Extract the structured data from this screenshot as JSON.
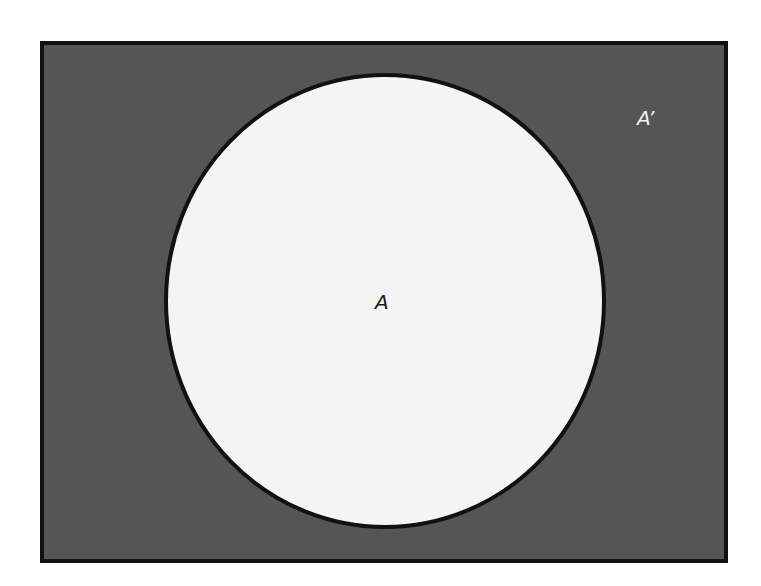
{
  "diagram": {
    "type": "venn",
    "universe": {
      "label": "A’",
      "fill": "#555555",
      "border": "#111111",
      "shaded": true
    },
    "sets": [
      {
        "label": "A",
        "fill": "#f4f4f4",
        "border": "#111111",
        "shaded": false
      }
    ]
  }
}
